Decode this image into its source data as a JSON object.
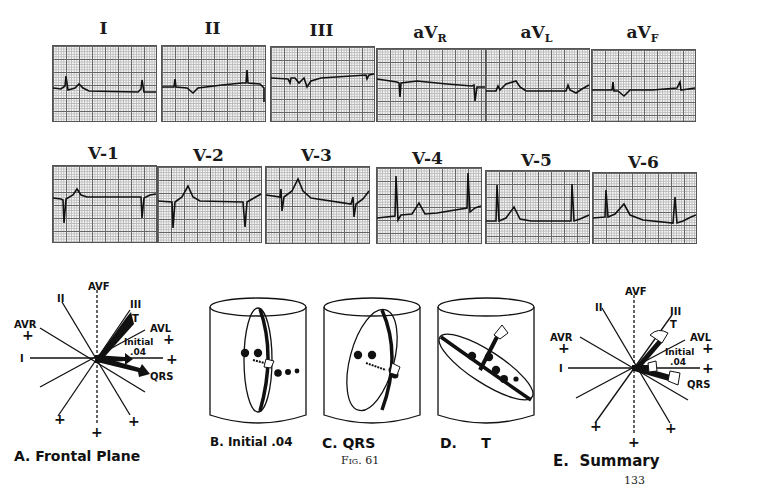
{
  "page": {
    "figure_label": "Fig. 61",
    "page_number": "133"
  },
  "limb_leads": [
    {
      "label": "I",
      "sub": ""
    },
    {
      "label": "II",
      "sub": ""
    },
    {
      "label": "III",
      "sub": ""
    },
    {
      "label": "aV",
      "sub": "R"
    },
    {
      "label": "aV",
      "sub": "L"
    },
    {
      "label": "aV",
      "sub": "F"
    }
  ],
  "precordial_leads": [
    {
      "label": "V-1"
    },
    {
      "label": "V-2"
    },
    {
      "label": "V-3"
    },
    {
      "label": "V-4"
    },
    {
      "label": "V-5"
    },
    {
      "label": "V-6"
    }
  ],
  "panels": {
    "a": {
      "caption": "A.  Frontal  Plane"
    },
    "b": {
      "caption": "B. Initial .04"
    },
    "c": {
      "caption": "C.   QRS"
    },
    "d": {
      "caption": "D.     T"
    },
    "e": {
      "caption": "E.  Summary"
    }
  },
  "axis_labels": {
    "avf": "AVF",
    "ii": "II",
    "iii": "III",
    "t": "T",
    "avr": "AVR",
    "avl": "AVL",
    "i": "I",
    "initial": "Initial",
    "initial_time": ".04",
    "qrs": "QRS",
    "plus": "+"
  }
}
